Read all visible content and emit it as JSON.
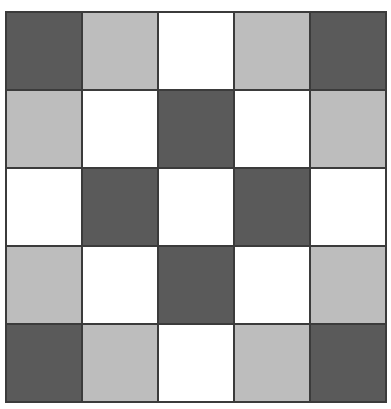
{
  "figure": {
    "title": "",
    "type": "checkerboard-grid",
    "rows": 5,
    "columns": 5,
    "background_color": "#ffffff",
    "grid_line_color": "#3b3b3b",
    "grid_line_width_px": 2,
    "grid_left_px": 5,
    "grid_top_px": 11,
    "grid_width_px": 382,
    "grid_height_px": 392
  },
  "palette": {
    "dark": "#5a5a5a",
    "light": "#bdbdbd",
    "white": "#ffffff"
  },
  "chart_data": {
    "type": "heatmap",
    "title": "",
    "xlabel": "",
    "ylabel": "",
    "categories": [
      "C1",
      "C2",
      "C3",
      "C4",
      "C5"
    ],
    "row_labels": [
      "R1",
      "R2",
      "R3",
      "R4",
      "R5"
    ],
    "legend": [],
    "grid": true,
    "value_map": {
      "dark": 2,
      "light": 1,
      "white": 0
    },
    "color_map": {
      "2": "#5a5a5a",
      "1": "#bdbdbd",
      "0": "#ffffff"
    },
    "values": [
      [
        2,
        1,
        0,
        1,
        2
      ],
      [
        1,
        0,
        2,
        0,
        1
      ],
      [
        0,
        2,
        0,
        2,
        0
      ],
      [
        1,
        0,
        2,
        0,
        1
      ],
      [
        2,
        1,
        0,
        1,
        2
      ]
    ],
    "cells": [
      {
        "row": 1,
        "col": 1,
        "shade": "dark",
        "color": "#5a5a5a"
      },
      {
        "row": 1,
        "col": 2,
        "shade": "light",
        "color": "#bdbdbd"
      },
      {
        "row": 1,
        "col": 3,
        "shade": "white",
        "color": "#ffffff"
      },
      {
        "row": 1,
        "col": 4,
        "shade": "light",
        "color": "#bdbdbd"
      },
      {
        "row": 1,
        "col": 5,
        "shade": "dark",
        "color": "#5a5a5a"
      },
      {
        "row": 2,
        "col": 1,
        "shade": "light",
        "color": "#bdbdbd"
      },
      {
        "row": 2,
        "col": 2,
        "shade": "white",
        "color": "#ffffff"
      },
      {
        "row": 2,
        "col": 3,
        "shade": "dark",
        "color": "#5a5a5a"
      },
      {
        "row": 2,
        "col": 4,
        "shade": "white",
        "color": "#ffffff"
      },
      {
        "row": 2,
        "col": 5,
        "shade": "light",
        "color": "#bdbdbd"
      },
      {
        "row": 3,
        "col": 1,
        "shade": "white",
        "color": "#ffffff"
      },
      {
        "row": 3,
        "col": 2,
        "shade": "dark",
        "color": "#5a5a5a"
      },
      {
        "row": 3,
        "col": 3,
        "shade": "white",
        "color": "#ffffff"
      },
      {
        "row": 3,
        "col": 4,
        "shade": "dark",
        "color": "#5a5a5a"
      },
      {
        "row": 3,
        "col": 5,
        "shade": "white",
        "color": "#ffffff"
      },
      {
        "row": 4,
        "col": 1,
        "shade": "light",
        "color": "#bdbdbd"
      },
      {
        "row": 4,
        "col": 2,
        "shade": "white",
        "color": "#ffffff"
      },
      {
        "row": 4,
        "col": 3,
        "shade": "dark",
        "color": "#5a5a5a"
      },
      {
        "row": 4,
        "col": 4,
        "shade": "white",
        "color": "#ffffff"
      },
      {
        "row": 4,
        "col": 5,
        "shade": "light",
        "color": "#bdbdbd"
      },
      {
        "row": 5,
        "col": 1,
        "shade": "dark",
        "color": "#5a5a5a"
      },
      {
        "row": 5,
        "col": 2,
        "shade": "light",
        "color": "#bdbdbd"
      },
      {
        "row": 5,
        "col": 3,
        "shade": "white",
        "color": "#ffffff"
      },
      {
        "row": 5,
        "col": 4,
        "shade": "light",
        "color": "#bdbdbd"
      },
      {
        "row": 5,
        "col": 5,
        "shade": "dark",
        "color": "#5a5a5a"
      }
    ]
  }
}
